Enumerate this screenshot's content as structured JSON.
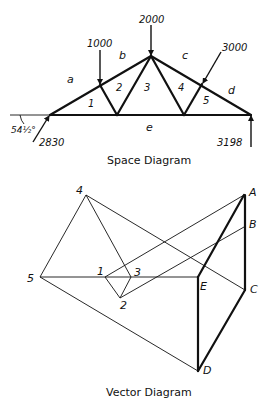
{
  "space_diagram": {
    "caption": "Space Diagram",
    "loads": {
      "load_1000": "1000",
      "load_2000": "2000",
      "load_3000": "3000"
    },
    "reactions": {
      "left": "2830",
      "right": "3198",
      "left_angle": "54½°"
    },
    "spaces": {
      "a": "a",
      "b": "b",
      "c": "c",
      "d": "d",
      "e": "e"
    },
    "panels": {
      "p1": "1",
      "p2": "2",
      "p3": "3",
      "p4": "4",
      "p5": "5"
    }
  },
  "vector_diagram": {
    "caption": "Vector Diagram",
    "points": {
      "A": "A",
      "B": "B",
      "C": "C",
      "D": "D",
      "E": "E",
      "n1": "1",
      "n2": "2",
      "n3": "3",
      "n4": "4",
      "n5": "5"
    }
  },
  "colors": {
    "ink": "#111111",
    "background": "#ffffff"
  }
}
